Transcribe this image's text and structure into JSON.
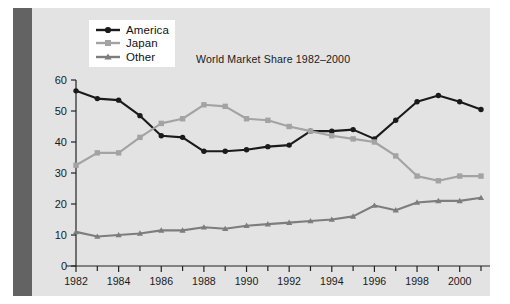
{
  "figure": {
    "background_color": "#ffffff",
    "panel_color": "#e3e3e3",
    "left_bar_color": "#636363"
  },
  "chart_data": {
    "type": "line",
    "title": "World Market Share 1982–2000",
    "xlabel": "",
    "ylabel": "",
    "xlim": [
      1982,
      2001
    ],
    "ylim": [
      0,
      60
    ],
    "grid": false,
    "legend_position": "top-left",
    "x": [
      1982,
      1983,
      1984,
      1985,
      1986,
      1987,
      1988,
      1989,
      1990,
      1991,
      1992,
      1993,
      1994,
      1995,
      1996,
      1997,
      1998,
      1999,
      2000,
      2001
    ],
    "xtick_labels": [
      "1982",
      "1984",
      "1986",
      "1988",
      "1990",
      "1992",
      "1994",
      "1996",
      "1998",
      "2000"
    ],
    "xtick_values": [
      1982,
      1984,
      1986,
      1988,
      1990,
      1992,
      1994,
      1996,
      1998,
      2000
    ],
    "xminor_ticks": [
      1983,
      1985,
      1987,
      1989,
      1991,
      1993,
      1995,
      1997,
      1999,
      2001
    ],
    "ytick_labels": [
      "0",
      "10",
      "20",
      "30",
      "40",
      "50",
      "60"
    ],
    "ytick_values": [
      0,
      10,
      20,
      30,
      40,
      50,
      60
    ],
    "series": [
      {
        "name": "America",
        "color": "#1a1a1a",
        "marker": "circle",
        "values": [
          56.5,
          54.0,
          53.5,
          48.5,
          42.0,
          41.5,
          37.0,
          37.0,
          37.5,
          38.5,
          39.0,
          43.5,
          43.5,
          44.0,
          41.0,
          47.0,
          53.0,
          55.0,
          53.0,
          50.5
        ]
      },
      {
        "name": "Japan",
        "color": "#a3a3a3",
        "marker": "square",
        "values": [
          32.5,
          36.5,
          36.5,
          41.5,
          46.0,
          47.5,
          52.0,
          51.5,
          47.5,
          47.0,
          45.0,
          43.5,
          42.0,
          41.0,
          40.0,
          35.5,
          29.0,
          27.5,
          29.0,
          29.0
        ]
      },
      {
        "name": "Other",
        "color": "#7d7d7d",
        "marker": "triangle",
        "values": [
          11.0,
          9.5,
          10.0,
          10.5,
          11.5,
          11.5,
          12.5,
          12.0,
          13.0,
          13.5,
          14.0,
          14.5,
          15.0,
          16.0,
          19.5,
          18.0,
          20.5,
          21.0,
          21.0,
          22.0
        ]
      }
    ]
  },
  "legend": {
    "items": [
      {
        "label": "America",
        "color": "#1a1a1a",
        "marker": "circle"
      },
      {
        "label": "Japan",
        "color": "#a3a3a3",
        "marker": "square"
      },
      {
        "label": "Other",
        "color": "#7d7d7d",
        "marker": "triangle"
      }
    ]
  }
}
